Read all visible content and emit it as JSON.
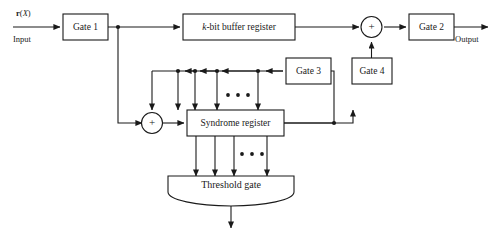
{
  "diagram": {
    "background_color": "#ffffff",
    "line_color": "#1a1a1a",
    "input_signal": {
      "symbol_bold": "r",
      "symbol_paren_open": "(",
      "symbol_italic": "X",
      "symbol_paren_close": ")",
      "full": "r(X)",
      "sublabel": "Input"
    },
    "output_label": "Output",
    "blocks": [
      {
        "id": "gate1",
        "label": "Gate 1"
      },
      {
        "id": "buffer",
        "label_italic": "k",
        "label_rest": "-bit buffer register",
        "full": "k-bit buffer register"
      },
      {
        "id": "gate2",
        "label": "Gate 2"
      },
      {
        "id": "gate3",
        "label": "Gate 3"
      },
      {
        "id": "gate4",
        "label": "Gate 4"
      },
      {
        "id": "syndrome",
        "label": "Syndrome register"
      },
      {
        "id": "threshold",
        "label": "Threshold gate"
      }
    ],
    "adders": [
      {
        "id": "adder-left",
        "symbol": "+"
      },
      {
        "id": "adder-right",
        "symbol": "+"
      }
    ],
    "ellipsis": {
      "symbol": "•",
      "count": 3,
      "locations": [
        "feedback-bus-taps",
        "syndrome-to-threshold-taps"
      ]
    }
  }
}
